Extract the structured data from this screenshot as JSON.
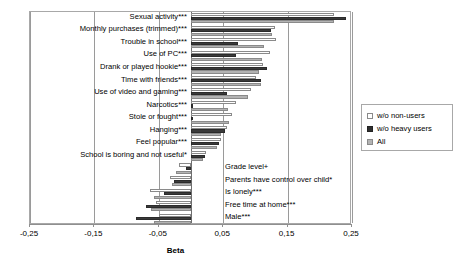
{
  "chart_data": {
    "type": "bar",
    "orientation": "horizontal",
    "title": "",
    "xlabel": "Beta",
    "ylabel": "",
    "xlim": [
      -0.25,
      0.25
    ],
    "xticks": [
      -0.25,
      -0.15,
      -0.05,
      0.05,
      0.15,
      0.25
    ],
    "xticklabels": [
      "-0,25",
      "-0,15",
      "-0,05",
      "0,05",
      "0,15",
      "0,25"
    ],
    "grid": true,
    "legend_position": "right",
    "legend": [
      "w/o non-users",
      "w/o heavy users",
      "All"
    ],
    "categories": [
      "Sexual activity***",
      "Monthly purchases (trimmed)***",
      "Trouble in school***",
      "Use of PC***",
      "Drank or played hookie***",
      "Time with friends***",
      "Use of video and gaming***",
      "Narcotics***",
      "Stole or fought***",
      "Hanging***",
      "Feel popular***",
      "School is boring and not useful*",
      "Grade level+",
      "Parents have control over child*",
      "Is lonely***",
      "Free time at home***",
      "Male***"
    ],
    "series": [
      {
        "name": "w/o non-users",
        "color": "#ffffff",
        "values": [
          0.222,
          0.13,
          0.132,
          0.122,
          0.112,
          0.101,
          0.093,
          0.07,
          0.063,
          0.056,
          0.046,
          0.023,
          -0.018,
          -0.032,
          -0.063,
          -0.055,
          -0.05
        ]
      },
      {
        "name": "w/o heavy users",
        "color": "#3a3a3a",
        "values": [
          0.24,
          0.124,
          0.073,
          0.07,
          0.118,
          0.108,
          0.056,
          0.002,
          0.0,
          0.053,
          0.043,
          0.021,
          -0.007,
          -0.027,
          -0.042,
          -0.07,
          -0.085
        ]
      },
      {
        "name": "All",
        "color": "#b3b3b3",
        "values": [
          0.222,
          0.126,
          0.113,
          0.11,
          0.106,
          0.109,
          0.088,
          0.057,
          0.059,
          0.047,
          0.04,
          0.018,
          -0.023,
          -0.03,
          -0.057,
          -0.062,
          -0.058
        ]
      }
    ]
  }
}
